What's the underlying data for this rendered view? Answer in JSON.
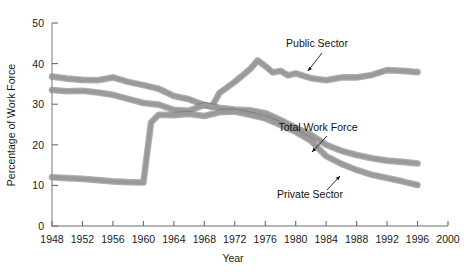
{
  "chart_data": {
    "type": "line",
    "title": "",
    "xlabel": "Year",
    "ylabel": "Percentage of Work Force",
    "xlim": [
      1948,
      2000
    ],
    "ylim": [
      0,
      50
    ],
    "xticks": [
      1948,
      1952,
      1956,
      1960,
      1964,
      1968,
      1972,
      1976,
      1980,
      1984,
      1988,
      1992,
      1996,
      2000
    ],
    "yticks": [
      0,
      10,
      20,
      30,
      40,
      50
    ],
    "grid": false,
    "legend": "annotations",
    "line_color": "#9a9a9a",
    "line_edge_color": "#6e6e6e",
    "series": [
      {
        "name": "Public Sector",
        "x": [
          1948,
          1950,
          1952,
          1954,
          1956,
          1958,
          1960,
          1962,
          1964,
          1966,
          1968,
          1969,
          1970,
          1972,
          1974,
          1975,
          1976,
          1977,
          1978,
          1979,
          1980,
          1982,
          1984,
          1986,
          1988,
          1990,
          1992,
          1994,
          1996
        ],
        "values": [
          36.8,
          36.3,
          36.0,
          35.9,
          36.6,
          35.5,
          34.7,
          33.8,
          32.0,
          31.2,
          29.8,
          29.4,
          32.8,
          35.5,
          38.6,
          40.8,
          39.4,
          37.8,
          38.2,
          37.1,
          37.6,
          36.4,
          35.9,
          36.6,
          36.6,
          37.2,
          38.4,
          38.2,
          37.9
        ]
      },
      {
        "name": "Total Work Force",
        "x": [
          1948,
          1950,
          1952,
          1954,
          1956,
          1958,
          1960,
          1962,
          1964,
          1966,
          1968,
          1970,
          1972,
          1974,
          1976,
          1978,
          1980,
          1982,
          1984,
          1986,
          1988,
          1990,
          1992,
          1994,
          1996
        ],
        "values": [
          33.5,
          33.2,
          33.3,
          32.9,
          32.3,
          31.3,
          30.3,
          29.9,
          28.6,
          28.4,
          29.8,
          29.1,
          28.7,
          28.5,
          27.8,
          26.1,
          24.2,
          22.5,
          20.0,
          18.5,
          17.5,
          16.7,
          16.1,
          15.8,
          15.4
        ]
      },
      {
        "name": "Private Sector",
        "x": [
          1948,
          1950,
          1952,
          1954,
          1956,
          1958,
          1960,
          1961,
          1962,
          1964,
          1966,
          1968,
          1970,
          1972,
          1974,
          1976,
          1978,
          1980,
          1982,
          1984,
          1986,
          1988,
          1990,
          1992,
          1994,
          1996
        ],
        "values": [
          12.0,
          11.8,
          11.6,
          11.3,
          11.0,
          10.8,
          10.7,
          25.5,
          27.4,
          27.3,
          27.6,
          27.1,
          28.0,
          28.2,
          27.4,
          26.5,
          24.9,
          23.2,
          21.0,
          17.2,
          15.3,
          13.8,
          12.6,
          11.8,
          11.0,
          10.1
        ]
      }
    ],
    "annotations": [
      {
        "name": "public-sector",
        "text": "Public Sector",
        "label_x": 317,
        "label_y": 47,
        "leader": {
          "x1": 322,
          "y1": 53,
          "x2": 308,
          "y2": 71
        }
      },
      {
        "name": "total-work-force",
        "text": "Total Work Force",
        "label_x": 318,
        "label_y": 131,
        "leader": {
          "x1": 327,
          "y1": 136,
          "x2": 312,
          "y2": 152
        }
      },
      {
        "name": "private-sector",
        "text": "Private Sector",
        "label_x": 310,
        "label_y": 198,
        "leader": {
          "x1": 327,
          "y1": 190,
          "x2": 340,
          "y2": 176
        }
      }
    ]
  },
  "layout": {
    "plot_left": 52,
    "plot_right": 448,
    "plot_top": 23,
    "plot_bottom": 226
  }
}
